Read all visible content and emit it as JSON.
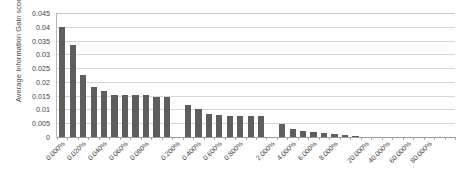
{
  "chart_data": {
    "type": "bar",
    "title": "",
    "xlabel": "",
    "ylabel": "Average Information Gain score",
    "ylim": [
      0,
      0.045
    ],
    "ytick_labels": [
      "0.045",
      "0.04",
      "0.035",
      "0.03",
      "0.025",
      "0.02",
      "0.015",
      "0.01",
      "0.005",
      "0"
    ],
    "ytick_values": [
      0.045,
      0.04,
      0.035,
      0.03,
      0.025,
      0.02,
      0.015,
      0.01,
      0.005,
      0
    ],
    "grid": "horizontal",
    "legend": "none",
    "bar_color": "#5e5e5e",
    "gridline_color": "#d6d6d6",
    "axis_color": "#9a9a9a",
    "background": "#ffffff",
    "xtick_labels": [
      "0.000%",
      "0.020%",
      "0.040%",
      "0.060%",
      "0.080%",
      "0.200%",
      "0.400%",
      "0.600%",
      "0.800%",
      "2.000%",
      "4.000%",
      "6.000%",
      "8.000%",
      "20.000%",
      "40.000%",
      "60.000%",
      "80.000%"
    ],
    "xtick_positions": [
      0,
      2,
      4,
      6,
      8,
      11,
      13,
      15,
      17,
      20,
      22,
      24,
      26,
      29,
      31,
      33,
      35
    ],
    "n_slots": 38,
    "values": [
      0.04,
      0.0335,
      0.0225,
      0.0183,
      0.0168,
      0.0153,
      0.0153,
      0.0153,
      0.0153,
      0.0145,
      0.0145,
      null,
      0.0117,
      0.01,
      0.0084,
      0.008,
      0.0076,
      0.0075,
      0.0075,
      0.0075,
      null,
      0.0048,
      0.003,
      0.0022,
      0.0018,
      0.0015,
      0.001,
      0.0007,
      0.0002,
      null,
      null,
      null,
      null,
      null,
      null,
      null,
      null,
      null
    ]
  }
}
